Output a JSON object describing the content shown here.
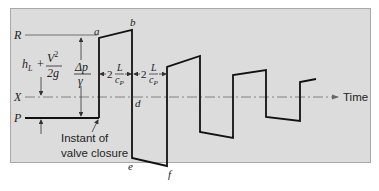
{
  "diagram": {
    "type": "waterhammer-pressure-vs-time",
    "level_labels": {
      "R": "R",
      "X": "X",
      "P": "P"
    },
    "point_labels": {
      "a": "a",
      "b": "b",
      "d": "d",
      "e": "e",
      "f": "f"
    },
    "head_loss_label": {
      "h": "h",
      "sub": "L",
      "plus": "+",
      "num": "V",
      "sup": "2",
      "den": "2g"
    },
    "delta_p_label": {
      "num": "Δp",
      "den": "γ"
    },
    "period_label_1": {
      "coef": "2",
      "num": "L",
      "den": "c",
      "den_sub": "P"
    },
    "period_label_2": {
      "coef": "2",
      "num": "L",
      "den": "c",
      "den_sub": "P"
    },
    "time_axis_label": "Time",
    "annotation": {
      "line1": "Instant of",
      "line2": "valve closure"
    },
    "colors": {
      "panel": "#dcdcdc",
      "line": "#111111",
      "axis": "#666666"
    }
  }
}
